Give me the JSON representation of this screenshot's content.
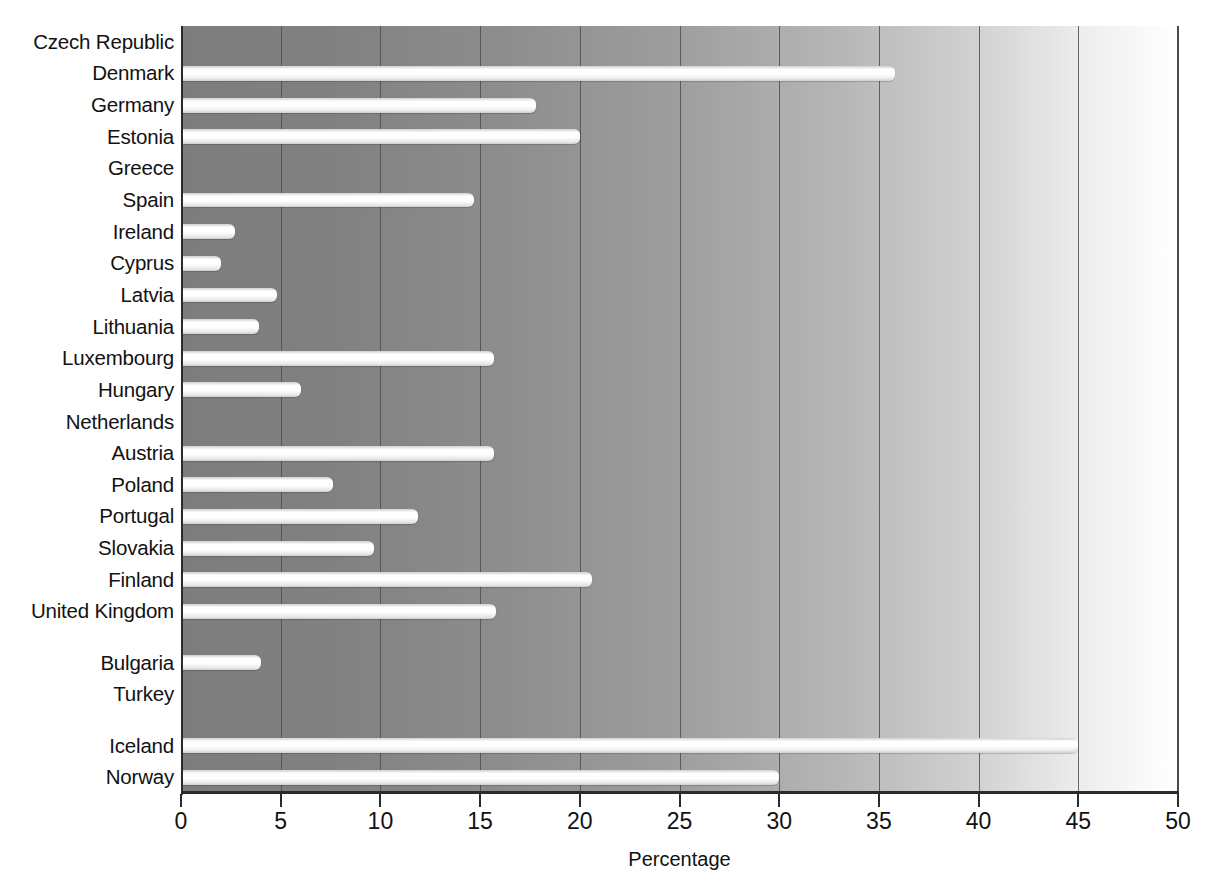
{
  "chart_data": {
    "type": "bar",
    "orientation": "horizontal",
    "title": "",
    "xlabel": "Percentage",
    "ylabel": "",
    "xlim": [
      0,
      50
    ],
    "xticks": [
      0,
      5,
      10,
      15,
      20,
      25,
      30,
      35,
      40,
      45,
      50
    ],
    "xtick_labels": [
      "0",
      "5",
      "10",
      "15",
      "20",
      "25",
      "30",
      "35",
      "40",
      "45",
      "50"
    ],
    "grid": true,
    "legend": "none",
    "categories": [
      "Czech Republic",
      "Denmark",
      "Germany",
      "Estonia",
      "Greece",
      "Spain",
      "Ireland",
      "Cyprus",
      "Latvia",
      "Lithuania",
      "Luxembourg",
      "Hungary",
      "Netherlands",
      "Austria",
      "Poland",
      "Portugal",
      "Slovakia",
      "Finland",
      "United Kingdom",
      "Bulgaria",
      "Turkey",
      "Iceland",
      "Norway"
    ],
    "values": [
      null,
      35.8,
      17.8,
      20.0,
      null,
      14.7,
      2.7,
      2.0,
      4.8,
      3.9,
      15.7,
      6.0,
      null,
      15.7,
      7.6,
      11.9,
      9.7,
      20.6,
      15.8,
      4.0,
      null,
      45.0,
      30.0
    ],
    "group_breaks_after": [
      "United Kingdom",
      "Turkey"
    ]
  },
  "colors": {
    "bar_fill": "#ffffff",
    "plot_background_left": "#7d7d7d",
    "plot_background_right": "#ffffff",
    "gridline": "#4e4e4e",
    "axis": "#2b2b2b",
    "text": "#111111"
  }
}
